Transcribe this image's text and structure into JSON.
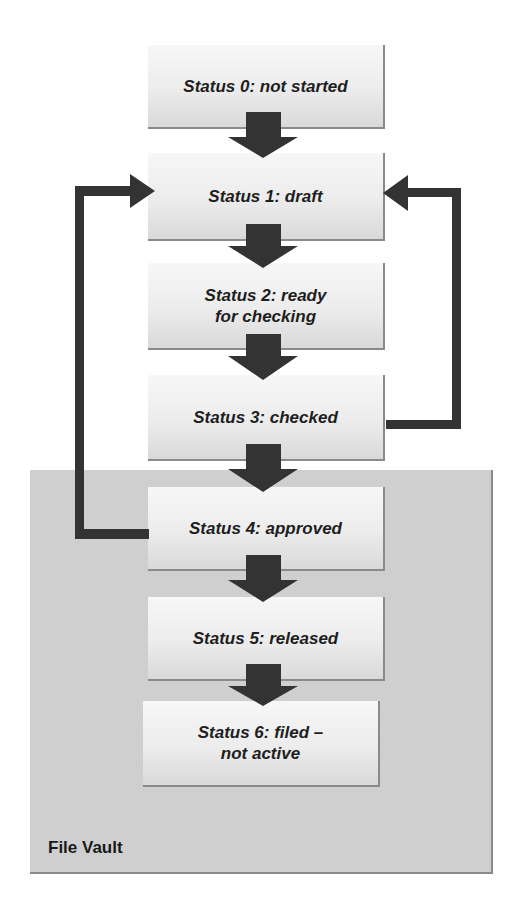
{
  "diagram": {
    "type": "status-workflow-flowchart",
    "statuses": [
      {
        "id": 0,
        "label": "Status 0: not started"
      },
      {
        "id": 1,
        "label": "Status 1: draft"
      },
      {
        "id": 2,
        "label": "Status 2: ready\nfor checking"
      },
      {
        "id": 3,
        "label": "Status 3: checked"
      },
      {
        "id": 4,
        "label": "Status 4: approved"
      },
      {
        "id": 5,
        "label": "Status 5: released"
      },
      {
        "id": 6,
        "label": "Status 6: filed –\nnot active"
      }
    ],
    "flows": [
      {
        "from": 0,
        "to": 1,
        "kind": "forward"
      },
      {
        "from": 1,
        "to": 2,
        "kind": "forward"
      },
      {
        "from": 2,
        "to": 3,
        "kind": "forward"
      },
      {
        "from": 3,
        "to": 4,
        "kind": "forward"
      },
      {
        "from": 4,
        "to": 5,
        "kind": "forward"
      },
      {
        "from": 5,
        "to": 6,
        "kind": "forward"
      },
      {
        "from": 3,
        "to": 1,
        "kind": "loop-back",
        "side": "right"
      },
      {
        "from": 4,
        "to": 1,
        "kind": "loop-back",
        "side": "left"
      }
    ],
    "region": {
      "label": "File Vault",
      "contains": [
        4,
        5,
        6
      ]
    },
    "colors": {
      "arrow": "#333333",
      "vault_bg": "#cfcfcf",
      "box_bg": "#ececec",
      "text": "#1e1e1e"
    }
  }
}
